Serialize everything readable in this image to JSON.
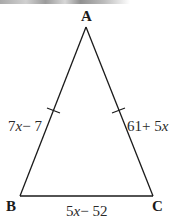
{
  "figure": {
    "type": "isosceles-triangle",
    "vertices": [
      {
        "id": "A",
        "label": "A"
      },
      {
        "id": "B",
        "label": "B"
      },
      {
        "id": "C",
        "label": "C"
      }
    ],
    "sides": [
      {
        "id": "AB",
        "label_parts": [
          "7",
          "x",
          "− 7"
        ],
        "congruence_ticks": 1
      },
      {
        "id": "AC",
        "label_parts": [
          "61+ 5",
          "x",
          ""
        ],
        "congruence_ticks": 1
      },
      {
        "id": "BC",
        "label_parts": [
          "5",
          "x",
          "− 52"
        ],
        "congruence_ticks": 0
      }
    ],
    "colors": {
      "line": "#1a1a1a",
      "text": "#2a2a2a",
      "background": "#ffffff"
    }
  }
}
